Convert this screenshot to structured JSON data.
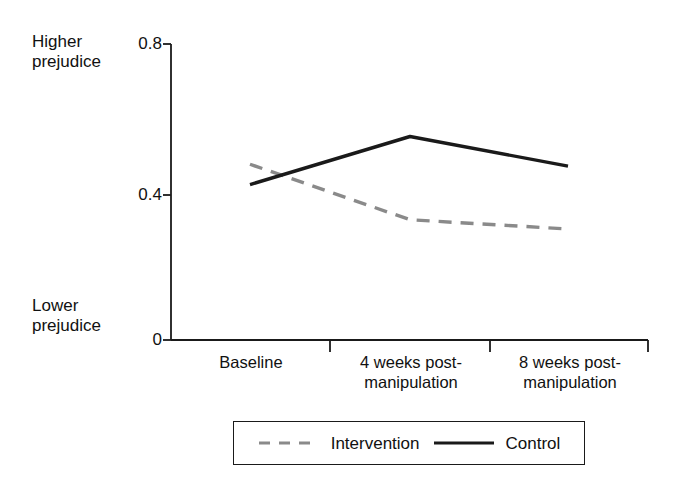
{
  "chart_data": {
    "type": "line",
    "title": "",
    "xlabel": "",
    "ylabel": "",
    "categories": [
      "Baseline",
      "4 weeks post-\nmanipulation",
      "8 weeks post-\nmanipulation"
    ],
    "series": [
      {
        "name": "Intervention",
        "values": [
          0.475,
          0.325,
          0.3
        ],
        "style": "dashed",
        "color": "#8a8a8a"
      },
      {
        "name": "Control",
        "values": [
          0.42,
          0.55,
          0.47
        ],
        "style": "solid",
        "color": "#1a1a1a"
      }
    ],
    "ylim": [
      0,
      0.8
    ],
    "yticks": [
      "0",
      "0.4",
      "0.8"
    ],
    "ytick_values": [
      0,
      0.4,
      0.8
    ],
    "grid": false,
    "legend_position": "bottom-center",
    "axis_annotations": {
      "top": "Higher\nprejudice",
      "bottom": "Lower\nprejudice"
    }
  },
  "axis": {
    "higher_label": "Higher\nprejudice",
    "lower_label": "Lower\nprejudice",
    "ytick_top": "0.8",
    "ytick_mid": "0.4",
    "ytick_zero": "0",
    "xtick_0": "Baseline",
    "xtick_1": "4 weeks post-\nmanipulation",
    "xtick_2": "8 weeks post-\nmanipulation"
  },
  "legend": {
    "intervention_label": "Intervention",
    "control_label": "Control",
    "intervention_color": "#8a8a8a",
    "control_color": "#1a1a1a"
  }
}
